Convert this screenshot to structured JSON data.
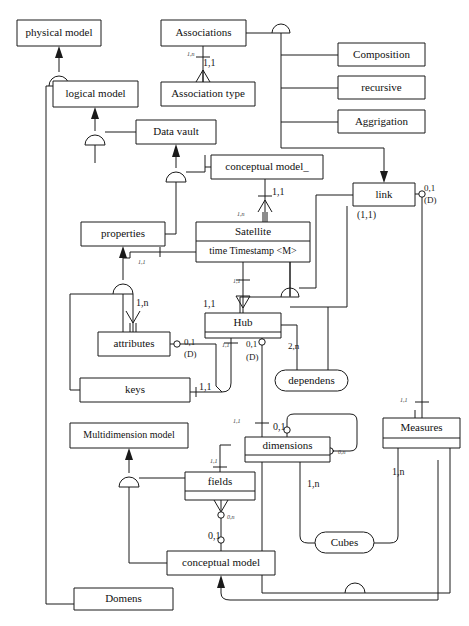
{
  "diagram": {
    "type": "entity-relationship-diagram",
    "notation": "IDEF1X / Barker crow-foot with subtype (arc) symbols",
    "canvas": {
      "width": 469,
      "height": 626
    },
    "stroke_color": "#1a1a1a",
    "fill_color": "#ffffff",
    "ghost_header": "",
    "entities": [
      {
        "id": "physical_model",
        "label": "physical model",
        "shape": "rect",
        "x": 17,
        "y": 20,
        "w": 84,
        "h": 26
      },
      {
        "id": "associations",
        "label": "Associations",
        "shape": "rect",
        "x": 161,
        "y": 20,
        "w": 85,
        "h": 26
      },
      {
        "id": "composition",
        "label": "Composition",
        "shape": "rect",
        "x": 338,
        "y": 43,
        "w": 87,
        "h": 23
      },
      {
        "id": "logical_model",
        "label": "logical model",
        "shape": "rect",
        "x": 53,
        "y": 81,
        "w": 85,
        "h": 26
      },
      {
        "id": "association_type",
        "label": "Association type",
        "shape": "rect",
        "x": 161,
        "y": 82,
        "w": 94,
        "h": 24
      },
      {
        "id": "recursive",
        "label": "recursive",
        "shape": "rect",
        "x": 338,
        "y": 76,
        "w": 87,
        "h": 23
      },
      {
        "id": "aggrigation",
        "label": "Aggrigation",
        "shape": "rect",
        "x": 338,
        "y": 110,
        "w": 87,
        "h": 23
      },
      {
        "id": "data_vault",
        "label": "Data vault",
        "shape": "rect",
        "x": 136,
        "y": 120,
        "w": 80,
        "h": 24
      },
      {
        "id": "conceptual_model_u",
        "label": "conceptual model_",
        "shape": "rect",
        "x": 211,
        "y": 155,
        "w": 112,
        "h": 24
      },
      {
        "id": "link",
        "label": "link",
        "shape": "rect",
        "x": 353,
        "y": 183,
        "w": 62,
        "h": 23
      },
      {
        "id": "satellite",
        "label": "Satellite",
        "shape": "rect-2comp",
        "x": 196,
        "y": 222,
        "w": 114,
        "h": 40,
        "divider": 19,
        "attribute": "time  Timestamp  <M>"
      },
      {
        "id": "properties",
        "label": "properties",
        "shape": "rect",
        "x": 81,
        "y": 222,
        "w": 84,
        "h": 24
      },
      {
        "id": "hub",
        "label": "Hub",
        "shape": "rect-2comp",
        "x": 205,
        "y": 313,
        "w": 76,
        "h": 25,
        "divider": 19
      },
      {
        "id": "attributes",
        "label": "attributes",
        "shape": "rect",
        "x": 98,
        "y": 332,
        "w": 72,
        "h": 24
      },
      {
        "id": "dependens",
        "label": "dependens",
        "shape": "rounded",
        "x": 275,
        "y": 370,
        "w": 73,
        "h": 21
      },
      {
        "id": "keys",
        "label": "keys",
        "shape": "rect",
        "x": 80,
        "y": 378,
        "w": 110,
        "h": 24
      },
      {
        "id": "measures",
        "label": "Measures",
        "shape": "rect-2comp",
        "x": 383,
        "y": 418,
        "w": 77,
        "h": 30,
        "divider": 20
      },
      {
        "id": "multidimension_model",
        "label": "Multidimension model",
        "shape": "rect",
        "x": 70,
        "y": 423,
        "w": 118,
        "h": 25
      },
      {
        "id": "dimensions",
        "label": "dimensions",
        "shape": "rect-2comp",
        "x": 245,
        "y": 437,
        "w": 85,
        "h": 25,
        "divider": 18
      },
      {
        "id": "fields",
        "label": "fields",
        "shape": "rect-2comp",
        "x": 185,
        "y": 472,
        "w": 70,
        "h": 28,
        "divider": 19
      },
      {
        "id": "cubes",
        "label": "Cubes",
        "shape": "rounded",
        "x": 315,
        "y": 532,
        "w": 59,
        "h": 21
      },
      {
        "id": "conceptual_model",
        "label": "conceptual model",
        "shape": "rect",
        "x": 167,
        "y": 551,
        "w": 108,
        "h": 24
      },
      {
        "id": "domens",
        "label": "Domens",
        "shape": "rect",
        "x": 74,
        "y": 588,
        "w": 99,
        "h": 22
      }
    ],
    "cardinalities": [
      {
        "id": "c-assoc-1n",
        "text": "1,n",
        "x": 187,
        "y": 50,
        "size": 6,
        "italic": true
      },
      {
        "id": "c-assoc-11",
        "text": "1,1",
        "x": 203,
        "y": 57,
        "size": 10
      },
      {
        "id": "c-cm-11",
        "text": "1,1",
        "x": 272,
        "y": 186,
        "size": 10
      },
      {
        "id": "c-sat-1n",
        "text": "1,n",
        "x": 237,
        "y": 210,
        "size": 6,
        "italic": true
      },
      {
        "id": "c-link-01",
        "text": "0,1",
        "x": 424,
        "y": 183,
        "size": 9
      },
      {
        "id": "c-link-d",
        "text": "(D)",
        "x": 424,
        "y": 195,
        "size": 9
      },
      {
        "id": "c-link-11",
        "text": "(1,1)",
        "x": 357,
        "y": 209,
        "size": 10
      },
      {
        "id": "c-prop-11",
        "text": "1,1",
        "x": 138,
        "y": 258,
        "size": 6,
        "italic": true
      },
      {
        "id": "c-attr-1n",
        "text": "1,n",
        "x": 136,
        "y": 297,
        "size": 10
      },
      {
        "id": "c-sat-hub-11",
        "text": "1,1",
        "x": 203,
        "y": 298,
        "size": 10
      },
      {
        "id": "c-hub-11b",
        "text": "1,1",
        "x": 233,
        "y": 277,
        "size": 6,
        "italic": true
      },
      {
        "id": "c-attr-01",
        "text": "0,1",
        "x": 184,
        "y": 337,
        "size": 9
      },
      {
        "id": "c-attr-d",
        "text": "(D)",
        "x": 184,
        "y": 349,
        "size": 9
      },
      {
        "id": "c-hub-11c",
        "text": "1,1",
        "x": 222,
        "y": 341,
        "size": 6,
        "italic": true
      },
      {
        "id": "c-hub-01",
        "text": "0,1",
        "x": 246,
        "y": 339,
        "size": 9
      },
      {
        "id": "c-hub-d",
        "text": "(D)",
        "x": 246,
        "y": 352,
        "size": 9
      },
      {
        "id": "c-dep-2n",
        "text": "2,n",
        "x": 288,
        "y": 341,
        "size": 9
      },
      {
        "id": "c-keys-11",
        "text": "1,1",
        "x": 199,
        "y": 381,
        "size": 10
      },
      {
        "id": "c-dim-11",
        "text": "1,1",
        "x": 233,
        "y": 417,
        "size": 6,
        "italic": true
      },
      {
        "id": "c-meas-11",
        "text": "1,1",
        "x": 400,
        "y": 396,
        "size": 6,
        "italic": true
      },
      {
        "id": "c-fields-11",
        "text": "1,1",
        "x": 210,
        "y": 457,
        "size": 6,
        "italic": true
      },
      {
        "id": "c-dim-01",
        "text": "0,1",
        "x": 273,
        "y": 421,
        "size": 10
      },
      {
        "id": "c-dim-0n",
        "text": "0,n",
        "x": 338,
        "y": 448,
        "size": 6,
        "italic": true
      },
      {
        "id": "c-dim-1n",
        "text": "1,n",
        "x": 307,
        "y": 478,
        "size": 10
      },
      {
        "id": "c-meas-1n",
        "text": "1,n",
        "x": 392,
        "y": 466,
        "size": 10
      },
      {
        "id": "c-fields-0n",
        "text": "0,n",
        "x": 227,
        "y": 513,
        "size": 6,
        "italic": true
      },
      {
        "id": "c-cm-01",
        "text": "0,1",
        "x": 208,
        "y": 530,
        "size": 10
      }
    ],
    "connector_legend": {
      "subtype_arc": "half-circle arc (generalization / category cluster)",
      "crowfoot": "crow-foot many end",
      "circle": "optional (zero) end",
      "tick": "mandatory (one) end",
      "arrow": "identifying relationship / inheritance direction"
    }
  }
}
